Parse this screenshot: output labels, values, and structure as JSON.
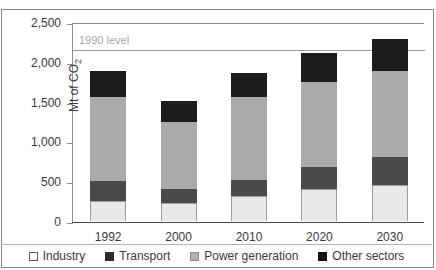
{
  "chart_data": {
    "type": "bar",
    "stacked": true,
    "title": "",
    "xlabel": "",
    "ylabel": "Mt of CO2",
    "ylabel_display": "Mt of CO",
    "ylabel_sub": "2",
    "ylim": [
      0,
      2500
    ],
    "yticks": [
      0,
      500,
      1000,
      1500,
      2000,
      2500
    ],
    "ytick_labels": [
      "0",
      "500",
      "1,000",
      "1,500",
      "2,000",
      "2,500"
    ],
    "grid": false,
    "legend_position": "bottom",
    "categories": [
      "1992",
      "2000",
      "2010",
      "2020",
      "2030"
    ],
    "series": [
      {
        "name": "Industry",
        "color": "#e8e8e8",
        "values": [
          250,
          230,
          310,
          400,
          450
        ]
      },
      {
        "name": "Transport",
        "color": "#4a4a4a",
        "values": [
          255,
          175,
          205,
          275,
          350
        ]
      },
      {
        "name": "Power generation",
        "color": "#aaaaaa",
        "values": [
          1050,
          840,
          1040,
          1075,
          1085
        ]
      },
      {
        "name": "Other sectors",
        "color": "#1c1c1c",
        "values": [
          330,
          265,
          310,
          360,
          405
        ]
      }
    ],
    "totals": [
      1885,
      1510,
      1865,
      2110,
      2290
    ],
    "annotations": [
      {
        "label": "1990 level",
        "value": 2170,
        "type": "horizontal-line",
        "color": "#9a9a9a"
      }
    ]
  },
  "legend": {
    "items": [
      {
        "label": "Industry"
      },
      {
        "label": "Transport"
      },
      {
        "label": "Power generation"
      },
      {
        "label": "Other sectors"
      }
    ]
  }
}
